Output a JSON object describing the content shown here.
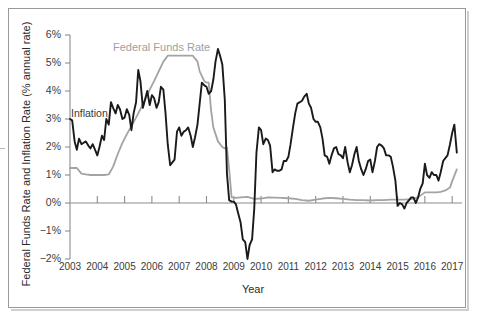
{
  "figure": {
    "background_color": "#ffffff",
    "frame_color": "#9a9a9a"
  },
  "axis": {
    "y_title": "Federal Funds Rate and Inflation Rate (% annual rate)",
    "x_title": "Year"
  },
  "series_labels": {
    "federal_funds_rate": "Federal Funds Rate",
    "inflation": "Inflation"
  },
  "chart_data": {
    "type": "line",
    "title": "",
    "xlabel": "Year",
    "ylabel": "Federal Funds Rate and Inflation Rate (% annual rate)",
    "xlim": [
      2003,
      2017.25
    ],
    "ylim": [
      -2,
      6
    ],
    "grid": false,
    "legend": "inline-annotations",
    "x_ticks": [
      2003,
      2004,
      2005,
      2006,
      2007,
      2008,
      2009,
      2010,
      2011,
      2012,
      2013,
      2014,
      2015,
      2016,
      2017
    ],
    "x_tick_labels": [
      "2003",
      "2004",
      "2005",
      "2006",
      "2007",
      "2008",
      "2009",
      "2010",
      "2011",
      "2012",
      "2013",
      "2014",
      "2015",
      "2016",
      "2017"
    ],
    "y_ticks": [
      -2,
      -1,
      0,
      1,
      2,
      3,
      4,
      5,
      6
    ],
    "y_tick_labels": [
      "−2%",
      "−1%",
      "0%",
      "1%",
      "2%",
      "3%",
      "4%",
      "5%",
      "6%"
    ],
    "series": [
      {
        "name": "Federal Funds Rate",
        "color": "#a3a3a3",
        "x": [
          2003.0,
          2003.25,
          2003.42,
          2003.58,
          2003.75,
          2004.0,
          2004.25,
          2004.42,
          2004.58,
          2004.75,
          2004.92,
          2005.08,
          2005.25,
          2005.42,
          2005.58,
          2005.75,
          2005.92,
          2006.08,
          2006.25,
          2006.42,
          2006.58,
          2006.75,
          2007.0,
          2007.25,
          2007.5,
          2007.67,
          2007.75,
          2007.92,
          2008.0,
          2008.08,
          2008.17,
          2008.25,
          2008.42,
          2008.58,
          2008.67,
          2008.75,
          2008.83,
          2008.92,
          2009.08,
          2009.25,
          2009.5,
          2009.75,
          2010.0,
          2010.25,
          2010.5,
          2010.75,
          2011.0,
          2011.25,
          2011.5,
          2011.75,
          2012.0,
          2012.25,
          2012.5,
          2012.75,
          2013.0,
          2013.25,
          2013.5,
          2013.75,
          2014.0,
          2014.25,
          2014.5,
          2014.75,
          2015.0,
          2015.25,
          2015.5,
          2015.75,
          2016.0,
          2016.25,
          2016.42,
          2016.58,
          2016.75,
          2016.92,
          2017.0,
          2017.17
        ],
        "values": [
          1.25,
          1.25,
          1.05,
          1.02,
          1.0,
          1.0,
          1.0,
          1.02,
          1.3,
          1.75,
          2.15,
          2.45,
          2.75,
          3.05,
          3.35,
          3.7,
          4.05,
          4.35,
          4.7,
          5.05,
          5.26,
          5.26,
          5.26,
          5.26,
          5.26,
          5.05,
          4.7,
          4.35,
          4.3,
          4.3,
          3.3,
          2.7,
          2.2,
          2.0,
          1.95,
          1.98,
          1.2,
          0.2,
          0.18,
          0.2,
          0.22,
          0.15,
          0.16,
          0.2,
          0.19,
          0.18,
          0.17,
          0.15,
          0.1,
          0.08,
          0.12,
          0.16,
          0.18,
          0.17,
          0.15,
          0.12,
          0.1,
          0.1,
          0.09,
          0.1,
          0.1,
          0.12,
          0.12,
          0.12,
          0.14,
          0.2,
          0.38,
          0.38,
          0.38,
          0.4,
          0.45,
          0.55,
          0.78,
          1.2
        ]
      },
      {
        "name": "Inflation",
        "color": "#1a1a1a",
        "x": [
          2003.0,
          2003.08,
          2003.17,
          2003.25,
          2003.33,
          2003.42,
          2003.5,
          2003.58,
          2003.67,
          2003.75,
          2003.83,
          2003.92,
          2004.0,
          2004.08,
          2004.17,
          2004.25,
          2004.33,
          2004.42,
          2004.5,
          2004.58,
          2004.67,
          2004.75,
          2004.83,
          2004.92,
          2005.0,
          2005.08,
          2005.17,
          2005.25,
          2005.33,
          2005.42,
          2005.5,
          2005.58,
          2005.67,
          2005.75,
          2005.83,
          2005.92,
          2006.0,
          2006.08,
          2006.17,
          2006.25,
          2006.33,
          2006.42,
          2006.5,
          2006.58,
          2006.67,
          2006.75,
          2006.83,
          2006.92,
          2007.0,
          2007.08,
          2007.17,
          2007.25,
          2007.33,
          2007.42,
          2007.5,
          2007.58,
          2007.67,
          2007.75,
          2007.83,
          2007.92,
          2008.0,
          2008.08,
          2008.17,
          2008.25,
          2008.33,
          2008.42,
          2008.5,
          2008.58,
          2008.67,
          2008.75,
          2008.83,
          2008.92,
          2009.0,
          2009.08,
          2009.17,
          2009.25,
          2009.33,
          2009.42,
          2009.5,
          2009.58,
          2009.67,
          2009.75,
          2009.83,
          2009.92,
          2010.0,
          2010.08,
          2010.17,
          2010.25,
          2010.33,
          2010.42,
          2010.5,
          2010.58,
          2010.67,
          2010.75,
          2010.83,
          2010.92,
          2011.0,
          2011.08,
          2011.17,
          2011.25,
          2011.33,
          2011.42,
          2011.5,
          2011.58,
          2011.67,
          2011.75,
          2011.83,
          2011.92,
          2012.0,
          2012.08,
          2012.17,
          2012.25,
          2012.33,
          2012.42,
          2012.5,
          2012.58,
          2012.67,
          2012.75,
          2012.83,
          2012.92,
          2013.0,
          2013.08,
          2013.17,
          2013.25,
          2013.33,
          2013.42,
          2013.5,
          2013.58,
          2013.67,
          2013.75,
          2013.83,
          2013.92,
          2014.0,
          2014.08,
          2014.17,
          2014.25,
          2014.33,
          2014.42,
          2014.5,
          2014.58,
          2014.67,
          2014.75,
          2014.83,
          2014.92,
          2015.0,
          2015.08,
          2015.17,
          2015.25,
          2015.33,
          2015.42,
          2015.5,
          2015.58,
          2015.67,
          2015.75,
          2015.83,
          2015.92,
          2016.0,
          2016.08,
          2016.17,
          2016.25,
          2016.33,
          2016.42,
          2016.5,
          2016.58,
          2016.67,
          2016.75,
          2016.83,
          2016.92,
          2017.0,
          2017.08,
          2017.17
        ],
        "values": [
          3.0,
          2.95,
          2.2,
          1.9,
          2.3,
          2.1,
          2.15,
          2.2,
          2.05,
          1.95,
          2.1,
          1.9,
          1.7,
          2.0,
          2.4,
          2.25,
          3.0,
          2.8,
          3.6,
          3.4,
          3.2,
          3.5,
          3.35,
          3.0,
          3.05,
          3.35,
          3.15,
          2.6,
          3.2,
          3.6,
          4.75,
          4.35,
          3.4,
          3.7,
          4.0,
          3.5,
          3.85,
          3.75,
          3.4,
          3.6,
          4.15,
          4.05,
          3.2,
          2.1,
          1.35,
          1.45,
          1.55,
          2.55,
          2.7,
          2.4,
          2.55,
          2.6,
          2.7,
          2.4,
          2.0,
          2.35,
          2.8,
          3.55,
          4.3,
          4.2,
          4.15,
          3.9,
          4.0,
          4.4,
          5.05,
          5.5,
          5.25,
          4.95,
          3.7,
          1.05,
          0.1,
          0.05,
          0.05,
          -0.05,
          -0.4,
          -0.7,
          -1.3,
          -1.4,
          -2.0,
          -1.5,
          -1.3,
          -0.2,
          1.8,
          2.7,
          2.6,
          2.1,
          2.3,
          2.25,
          2.05,
          1.1,
          1.2,
          1.15,
          1.15,
          1.2,
          1.5,
          1.5,
          1.65,
          2.1,
          2.7,
          3.2,
          3.55,
          3.6,
          3.65,
          3.8,
          3.9,
          3.55,
          3.4,
          3.0,
          2.9,
          2.9,
          2.7,
          2.3,
          1.7,
          1.65,
          1.4,
          1.7,
          1.95,
          2.0,
          1.75,
          1.7,
          1.6,
          2.0,
          1.45,
          1.1,
          1.35,
          1.75,
          2.0,
          1.5,
          1.2,
          1.0,
          1.2,
          1.5,
          1.55,
          1.1,
          1.5,
          2.0,
          2.1,
          2.05,
          1.95,
          1.7,
          1.7,
          1.65,
          1.3,
          0.8,
          -0.1,
          0.0,
          -0.05,
          -0.2,
          0.0,
          0.1,
          0.2,
          0.2,
          0.0,
          0.2,
          0.5,
          0.7,
          1.4,
          1.0,
          0.9,
          1.1,
          1.0,
          1.0,
          0.8,
          1.1,
          1.5,
          1.6,
          1.7,
          2.1,
          2.5,
          2.8,
          1.8
        ]
      }
    ]
  }
}
